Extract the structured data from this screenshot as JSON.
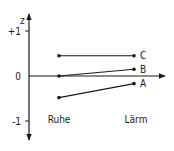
{
  "chart_data": {
    "type": "line",
    "title": "",
    "xlabel": "",
    "ylabel": "z",
    "categories": [
      "Ruhe",
      "Lärm"
    ],
    "ylim": [
      -1.3,
      1.35
    ],
    "yticks": [
      {
        "value": 1,
        "label": "+1"
      },
      {
        "value": 0,
        "label": "0"
      },
      {
        "value": -1,
        "label": "-1"
      }
    ],
    "series": [
      {
        "name": "C",
        "values": [
          0.45,
          0.45
        ]
      },
      {
        "name": "B",
        "values": [
          0.0,
          0.15
        ]
      },
      {
        "name": "A",
        "values": [
          -0.48,
          -0.17
        ]
      }
    ],
    "grid": false,
    "legend": "series labels at right end of lines",
    "colors": {
      "ink": "#1a1a1a"
    }
  }
}
